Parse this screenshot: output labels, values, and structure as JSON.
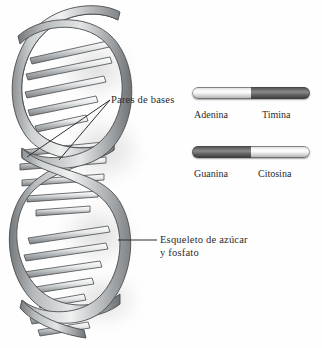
{
  "figure": {
    "background_color": "#ffffff",
    "text_color": "#2c2c2c"
  },
  "annotations": {
    "base_pairs": {
      "label": "Pares de bases",
      "icon": "leader-line-icon"
    },
    "backbone": {
      "line1": "Esqueleto de azúcar",
      "line2": "y fosfato",
      "icon": "leader-line-icon"
    }
  },
  "base_pair_bars": [
    {
      "id": "adenina-timina",
      "left": {
        "label": "Adenina",
        "tone": "light",
        "color": "#e8e8e8"
      },
      "right": {
        "label": "Timina",
        "tone": "dark",
        "color": "#6d6d6d"
      }
    },
    {
      "id": "guanina-citosina",
      "left": {
        "label": "Guanina",
        "tone": "dark",
        "color": "#6d6d6d"
      },
      "right": {
        "label": "Citosina",
        "tone": "light",
        "color": "#e8e8e8"
      }
    }
  ],
  "helix": {
    "name": "dna-double-helix",
    "backbone_color": "#b9bcbd",
    "backbone_shade": "#7e8284",
    "rung_color": "#dcdedf",
    "outline_color": "#4a4c4e",
    "shadow_color": "#d2d2d2"
  }
}
